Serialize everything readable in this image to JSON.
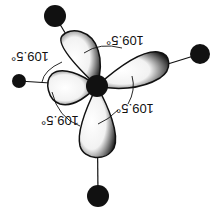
{
  "diagram": {
    "type": "tetrahedral-hybrid-orbitals",
    "orientation": "rotated-180",
    "colors": {
      "background": "#ffffff",
      "ink": "#111111",
      "lobe_fill": "#ffffff",
      "lobe_shade": "#222222"
    },
    "nucleus": {
      "cx": 97,
      "cy": 86,
      "r": 11
    },
    "atoms": [
      {
        "id": "upper-left",
        "cx": 55,
        "cy": 16,
        "r": 11
      },
      {
        "id": "right",
        "cx": 200,
        "cy": 54,
        "r": 10
      },
      {
        "id": "left",
        "cx": 19,
        "cy": 81,
        "r": 7
      },
      {
        "id": "bottom",
        "cx": 98,
        "cy": 196,
        "r": 11
      }
    ],
    "angle_labels": [
      {
        "text": "109.5°",
        "x": 125,
        "y": 40
      },
      {
        "text": "109.5°",
        "x": 30,
        "y": 56
      },
      {
        "text": "109.5°",
        "x": 135,
        "y": 108
      },
      {
        "text": "109.5°",
        "x": 60,
        "y": 120
      }
    ]
  }
}
